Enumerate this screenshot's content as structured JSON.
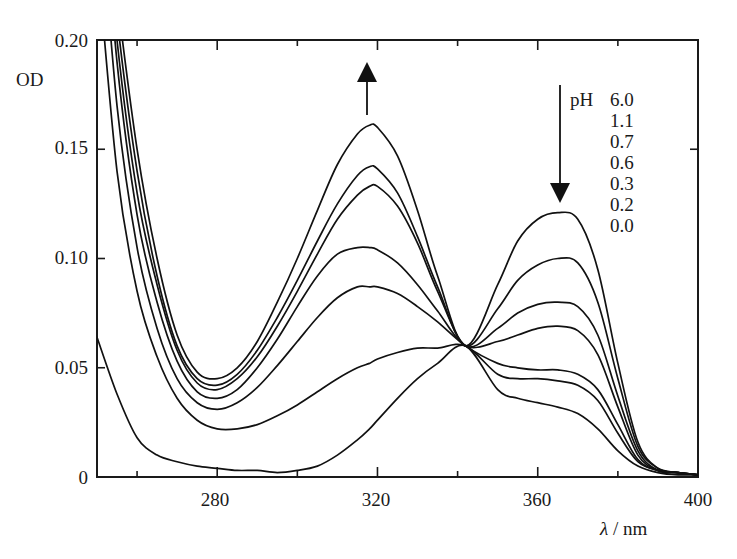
{
  "chart_data": {
    "type": "line",
    "title": "",
    "xlabel": "λ / nm",
    "ylabel": "OD",
    "xlim": [
      250,
      400
    ],
    "ylim": [
      0,
      0.2
    ],
    "x_ticks": [
      280,
      320,
      360,
      400
    ],
    "x_minor_ticks": [
      260,
      300,
      340,
      380
    ],
    "y_ticks": [
      0,
      0.05,
      0.1,
      0.15,
      0.2
    ],
    "y_tick_labels": [
      "0",
      "0.05",
      "0.10",
      "0.15",
      "0.20"
    ],
    "grid": false,
    "legend": {
      "title": "pH",
      "entries": [
        "6.0",
        "1.1",
        "0.7",
        "0.6",
        "0.3",
        "0.2",
        "0.0"
      ],
      "position": "top-right",
      "note": "The figure lists these pH values but does not visibly say which curve each belongs to; no pH is assigned to a series here."
    },
    "annotations": [
      {
        "type": "arrow",
        "direction": "up",
        "x": 318,
        "y_from": 0.166,
        "y_to": 0.192
      },
      {
        "type": "arrow",
        "direction": "down",
        "x": 365,
        "y_from": 0.178,
        "y_to": 0.125
      },
      {
        "type": "isosbestic_point",
        "x": 342,
        "y": 0.06
      }
    ],
    "series_ordering": "Series are named by the order of their 365 nm band, highest to lowest. This naming does not imply a pH value.",
    "x": [
      250,
      255,
      260,
      265,
      270,
      275,
      280,
      285,
      290,
      295,
      300,
      305,
      310,
      315,
      318,
      320,
      325,
      330,
      335,
      342,
      350,
      355,
      360,
      365,
      370,
      375,
      380,
      385,
      390,
      395,
      400
    ],
    "series": [
      {
        "name": "curve 1 (highest at 365 nm)",
        "values": [
          0.3,
          0.22,
          0.15,
          0.1,
          0.065,
          0.048,
          0.045,
          0.05,
          0.062,
          0.08,
          0.1,
          0.122,
          0.143,
          0.157,
          0.161,
          0.16,
          0.147,
          0.122,
          0.092,
          0.06,
          0.088,
          0.108,
          0.118,
          0.121,
          0.118,
          0.095,
          0.052,
          0.016,
          0.004,
          0.002,
          0.001
        ]
      },
      {
        "name": "curve 2",
        "values": [
          0.3,
          0.21,
          0.14,
          0.092,
          0.06,
          0.045,
          0.042,
          0.047,
          0.058,
          0.073,
          0.09,
          0.108,
          0.125,
          0.138,
          0.142,
          0.141,
          0.13,
          0.11,
          0.087,
          0.06,
          0.077,
          0.09,
          0.097,
          0.1,
          0.098,
          0.08,
          0.045,
          0.014,
          0.004,
          0.002,
          0.001
        ]
      },
      {
        "name": "curve 3",
        "values": [
          0.3,
          0.2,
          0.13,
          0.088,
          0.058,
          0.043,
          0.04,
          0.045,
          0.055,
          0.069,
          0.085,
          0.102,
          0.118,
          0.129,
          0.133,
          0.133,
          0.124,
          0.107,
          0.085,
          0.06,
          0.068,
          0.075,
          0.079,
          0.08,
          0.078,
          0.065,
          0.037,
          0.012,
          0.003,
          0.002,
          0.001
        ]
      },
      {
        "name": "curve 4",
        "values": [
          0.3,
          0.19,
          0.12,
          0.08,
          0.053,
          0.039,
          0.036,
          0.04,
          0.05,
          0.063,
          0.078,
          0.092,
          0.102,
          0.105,
          0.105,
          0.104,
          0.098,
          0.088,
          0.076,
          0.06,
          0.062,
          0.065,
          0.068,
          0.069,
          0.067,
          0.056,
          0.032,
          0.01,
          0.003,
          0.002,
          0.001
        ]
      },
      {
        "name": "curve 5",
        "values": [
          0.28,
          0.17,
          0.105,
          0.068,
          0.045,
          0.034,
          0.031,
          0.034,
          0.041,
          0.051,
          0.062,
          0.073,
          0.082,
          0.087,
          0.087,
          0.087,
          0.084,
          0.078,
          0.071,
          0.06,
          0.052,
          0.05,
          0.049,
          0.049,
          0.047,
          0.04,
          0.024,
          0.008,
          0.003,
          0.002,
          0.001
        ]
      },
      {
        "name": "curve 6",
        "values": [
          0.24,
          0.14,
          0.085,
          0.055,
          0.036,
          0.026,
          0.022,
          0.022,
          0.024,
          0.028,
          0.033,
          0.039,
          0.045,
          0.05,
          0.052,
          0.054,
          0.057,
          0.059,
          0.059,
          0.06,
          0.047,
          0.045,
          0.045,
          0.044,
          0.042,
          0.035,
          0.02,
          0.007,
          0.003,
          0.002,
          0.001
        ]
      },
      {
        "name": "curve 7 (lowest at 365 nm)",
        "values": [
          0.064,
          0.038,
          0.018,
          0.01,
          0.007,
          0.005,
          0.004,
          0.003,
          0.003,
          0.002,
          0.003,
          0.005,
          0.01,
          0.017,
          0.022,
          0.026,
          0.036,
          0.045,
          0.052,
          0.06,
          0.04,
          0.036,
          0.034,
          0.032,
          0.029,
          0.022,
          0.012,
          0.005,
          0.002,
          0.001,
          0.001
        ]
      }
    ]
  },
  "labels": {
    "y_axis_title": "OD",
    "x_axis_title": "λ / nm",
    "legend_title": "pH",
    "y_tick_0": "0",
    "y_tick_1": "0.05",
    "y_tick_2": "0.10",
    "y_tick_3": "0.15",
    "y_tick_4": "0.20",
    "x_tick_0": "280",
    "x_tick_1": "320",
    "x_tick_2": "360",
    "x_tick_3": "400",
    "legend_0": "6.0",
    "legend_1": "1.1",
    "legend_2": "0.7",
    "legend_3": "0.6",
    "legend_4": "0.3",
    "legend_5": "0.2",
    "legend_6": "0.0"
  },
  "colors": {
    "line": "#111111",
    "axis": "#1a1a1a",
    "background": "#ffffff"
  }
}
